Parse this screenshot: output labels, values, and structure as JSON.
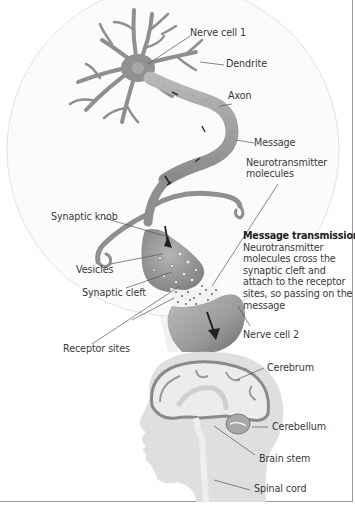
{
  "diagram": {
    "neuron_labels": {
      "nerve_cell_1": "Nerve cell 1",
      "dendrite": "Dendrite",
      "axon": "Axon",
      "message": "Message",
      "neurotransmitter_line1": "Neurotransmitter",
      "neurotransmitter_line2": "molecules",
      "synaptic_knob": "Synaptic knob",
      "vesicles": "Vesicles",
      "synaptic_cleft": "Synaptic cleft",
      "receptor_sites": "Receptor sites",
      "nerve_cell_2": "Nerve cell 2"
    },
    "callout": {
      "title": "Message transmission",
      "body": "Neurotransmitter molecules cross the synaptic cleft and attach to the receptor sites, so passing on the message"
    },
    "brain_labels": {
      "cerebrum": "Cerebrum",
      "cerebellum": "Cerebellum",
      "brain_stem": "Brain stem",
      "spinal_cord": "Spinal cord"
    },
    "colors": {
      "cell_fill": "#9a9a9a",
      "cell_dark": "#6e6e6e",
      "circle_fill": "#fafafa",
      "head_fill": "#dedede",
      "brain_fill": "#e9e9e9",
      "cortex": "#8a8a8a",
      "leader_line": "#555555",
      "frame": "#9a9a9a"
    }
  }
}
